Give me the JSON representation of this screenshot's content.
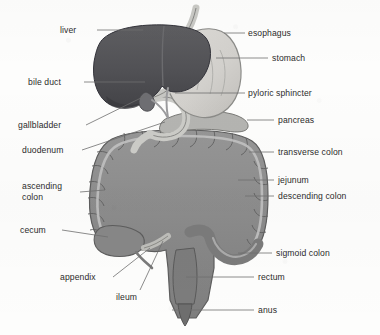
{
  "figure": {
    "width": 380,
    "height": 335,
    "style": "grayscale scanned line illustration",
    "background_color": "#fdfdfc"
  },
  "palette": {
    "liver": "#555558",
    "liver_shadow": "#3f3f43",
    "stomach": "#d4d4d2",
    "stomach_edge": "#8e8e8c",
    "colon": "#8d8d8d",
    "colon_dark": "#777777",
    "colon_taenia": "#bcbcbc",
    "small_intestine": "#cfcfcb",
    "small_intestine_line": "#8a8a86",
    "duodenum": "#c9c9c6",
    "pancreas": "#b2b2b0",
    "outline": "#4a4a4a",
    "leader_line": "#6f6f6f",
    "text": "#2b2b2b"
  },
  "labels": {
    "left": [
      {
        "id": "liver",
        "text": "liver",
        "x": 60,
        "y": 25,
        "anchor_x": 97,
        "anchor_y": 30,
        "target_x": 143,
        "target_y": 30
      },
      {
        "id": "bile-duct",
        "text": "bile duct",
        "x": 28,
        "y": 77,
        "anchor_x": 84,
        "anchor_y": 82,
        "target_x": 145,
        "target_y": 82
      },
      {
        "id": "gallbladder",
        "text": "gallbladder",
        "x": 18,
        "y": 120,
        "anchor_x": 86,
        "anchor_y": 125,
        "target_x": 147,
        "target_y": 95
      },
      {
        "id": "duodenum",
        "text": "duodenum",
        "x": 22,
        "y": 145,
        "anchor_x": 82,
        "anchor_y": 150,
        "target_x": 165,
        "target_y": 122
      },
      {
        "id": "ascending-colon",
        "text": "ascending\ncolon",
        "x": 22,
        "y": 181,
        "anchor_x": 80,
        "anchor_y": 192,
        "target_x": 105,
        "target_y": 190
      },
      {
        "id": "cecum",
        "text": "cecum",
        "x": 20,
        "y": 225,
        "anchor_x": 62,
        "anchor_y": 230,
        "target_x": 108,
        "target_y": 237
      },
      {
        "id": "appendix",
        "text": "appendix",
        "x": 60,
        "y": 272,
        "anchor_x": 113,
        "anchor_y": 277,
        "target_x": 148,
        "target_y": 247
      },
      {
        "id": "ileum",
        "text": "ileum",
        "x": 116,
        "y": 292,
        "anchor_x": 140,
        "anchor_y": 292,
        "target_x": 162,
        "target_y": 240
      }
    ],
    "right": [
      {
        "id": "esophagus",
        "text": "esophagus",
        "x": 248,
        "y": 28,
        "anchor_x": 245,
        "anchor_y": 33,
        "target_x": 224,
        "target_y": 33
      },
      {
        "id": "stomach",
        "text": "stomach",
        "x": 272,
        "y": 53,
        "anchor_x": 268,
        "anchor_y": 58,
        "target_x": 216,
        "target_y": 58
      },
      {
        "id": "pyloric-sphincter",
        "text": "pyloric sphincter",
        "x": 248,
        "y": 88,
        "anchor_x": 245,
        "anchor_y": 93,
        "target_x": 175,
        "target_y": 93
      },
      {
        "id": "pancreas",
        "text": "pancreas",
        "x": 278,
        "y": 115,
        "anchor_x": 274,
        "anchor_y": 120,
        "target_x": 247,
        "target_y": 120
      },
      {
        "id": "transverse-colon",
        "text": "transverse colon",
        "x": 278,
        "y": 147,
        "anchor_x": 274,
        "anchor_y": 152,
        "target_x": 249,
        "target_y": 152
      },
      {
        "id": "jejunum",
        "text": "jejunum",
        "x": 278,
        "y": 175,
        "anchor_x": 274,
        "anchor_y": 180,
        "target_x": 238,
        "target_y": 180
      },
      {
        "id": "descending-colon",
        "text": "descending colon",
        "x": 278,
        "y": 191,
        "anchor_x": 274,
        "anchor_y": 196,
        "target_x": 245,
        "target_y": 196
      },
      {
        "id": "sigmoid-colon",
        "text": "sigmoid colon",
        "x": 276,
        "y": 248,
        "anchor_x": 272,
        "anchor_y": 253,
        "target_x": 238,
        "target_y": 253
      },
      {
        "id": "rectum",
        "text": "rectum",
        "x": 258,
        "y": 272,
        "anchor_x": 254,
        "anchor_y": 277,
        "target_x": 186,
        "target_y": 277
      },
      {
        "id": "anus",
        "text": "anus",
        "x": 258,
        "y": 305,
        "anchor_x": 254,
        "anchor_y": 310,
        "target_x": 172,
        "target_y": 310
      }
    ]
  }
}
